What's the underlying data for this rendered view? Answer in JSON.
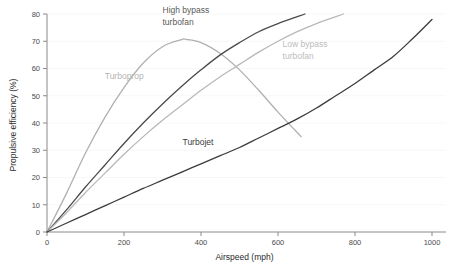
{
  "chart_data": {
    "type": "line",
    "title": "",
    "xlabel": "Airspeed (mph)",
    "ylabel": "Propulsive efficiency (%)",
    "xlim": [
      0,
      1000
    ],
    "ylim": [
      0,
      80
    ],
    "xticks": [
      "0",
      "200",
      "400",
      "600",
      "800",
      "1000"
    ],
    "yticks": [
      "0",
      "10",
      "20",
      "30",
      "40",
      "50",
      "60",
      "70",
      "80"
    ],
    "grid": "horizontal-faint",
    "legend": "inline-labels",
    "series": [
      {
        "name": "Turboprop",
        "color": "#b0b0b0",
        "label_x": 150,
        "label_y": 56,
        "x": [
          0,
          50,
          100,
          150,
          200,
          250,
          300,
          350,
          360,
          400,
          450,
          500,
          550,
          600,
          660
        ],
        "y": [
          0,
          14,
          29,
          42,
          53,
          62,
          68,
          70.6,
          70.7,
          69.5,
          65.5,
          59.5,
          52,
          44,
          35
        ]
      },
      {
        "name": "High bypass turbofan",
        "color": "#4a4a4a",
        "label_x": 310,
        "label_y": 80,
        "label_line2": "turbofan",
        "x": [
          0,
          50,
          100,
          150,
          200,
          250,
          300,
          350,
          400,
          450,
          500,
          550,
          600,
          670
        ],
        "y": [
          0,
          8,
          16.5,
          24.5,
          32.5,
          40,
          47,
          53.5,
          59.5,
          65,
          69.5,
          73.5,
          76.5,
          80
        ]
      },
      {
        "name": "Low bypass turbofan",
        "color": "#b8b8b8",
        "label_x": 620,
        "label_y": 68,
        "label_line2": "turbofan",
        "x": [
          0,
          50,
          100,
          150,
          200,
          250,
          300,
          350,
          400,
          450,
          500,
          550,
          600,
          650,
          700,
          770
        ],
        "y": [
          0,
          7,
          14.5,
          21.5,
          28.5,
          35,
          41,
          46.5,
          52,
          57,
          61.5,
          66,
          70,
          73.5,
          76.5,
          80
        ]
      },
      {
        "name": "Turbojet",
        "color": "#3c3c3c",
        "label_x": 350,
        "label_y": 32,
        "x": [
          0,
          50,
          100,
          150,
          200,
          250,
          300,
          350,
          400,
          450,
          500,
          550,
          600,
          650,
          700,
          750,
          800,
          850,
          900,
          950,
          1000
        ],
        "y": [
          0,
          3.2,
          6.4,
          9.6,
          12.8,
          16,
          19,
          22,
          25,
          28,
          31,
          34.5,
          38,
          41.5,
          45.5,
          50,
          54.5,
          59.5,
          64.5,
          71,
          78
        ]
      }
    ],
    "series_labels": [
      {
        "name": "Turboprop",
        "text": "Turboprop"
      },
      {
        "name": "High bypass turbofan",
        "line1": "High bypass",
        "line2": "turbofan"
      },
      {
        "name": "Low bypass turbofan",
        "line1": "Low bypass",
        "line2": "turbofan"
      },
      {
        "name": "Turbojet",
        "text": "Turbojet"
      }
    ]
  },
  "labels": {
    "xlabel": "Airspeed (mph)",
    "ylabel": "Propulsive efficiency (%)",
    "turboprop": "Turboprop",
    "high_bypass_l1": "High bypass",
    "high_bypass_l2": "turbofan",
    "low_bypass_l1": "Low bypass",
    "low_bypass_l2": "turbofan",
    "turbojet": "Turbojet",
    "x0": "0",
    "x200": "200",
    "x400": "400",
    "x600": "600",
    "x800": "800",
    "x1000": "1000",
    "y0": "0",
    "y10": "10",
    "y20": "20",
    "y30": "30",
    "y40": "40",
    "y50": "50",
    "y60": "60",
    "y70": "70",
    "y80": "80"
  }
}
